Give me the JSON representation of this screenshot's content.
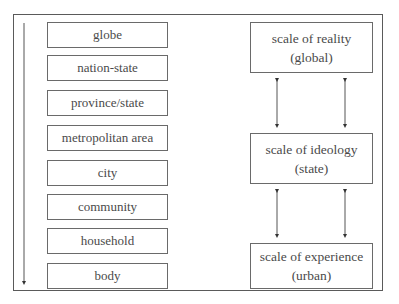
{
  "diagram": {
    "hierarchy_arrow": {
      "direction": "down"
    },
    "left_scales": [
      {
        "label": "globe"
      },
      {
        "label": "nation-state"
      },
      {
        "label": "province/state"
      },
      {
        "label": "metropolitan area"
      },
      {
        "label": "city"
      },
      {
        "label": "community"
      },
      {
        "label": "household"
      },
      {
        "label": "body"
      }
    ],
    "right_scales": [
      {
        "title": "scale of reality",
        "subtitle": "(global)"
      },
      {
        "title": "scale of ideology",
        "subtitle": "(state)"
      },
      {
        "title": "scale of experience",
        "subtitle": "(urban)"
      }
    ],
    "connectors": "bidirectional arrows (two per adjacent pair)"
  }
}
